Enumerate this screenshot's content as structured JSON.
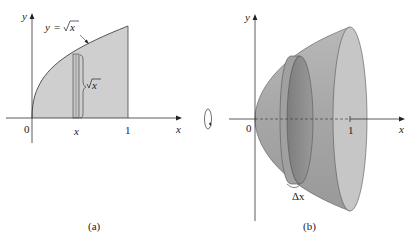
{
  "panel_a": {
    "caption": "(a)",
    "curve_label": "y = √x",
    "curve_label_y": "y",
    "curve_label_eq": "=",
    "curve_label_sqrt": "√",
    "curve_label_x": "x",
    "strip_height_label_sqrt": "√",
    "strip_height_label_x": "x",
    "axis_x_label": "x",
    "axis_y_label": "y",
    "origin_label": "0",
    "tick_x_label": "x",
    "tick_one_label": "1"
  },
  "panel_b": {
    "caption": "(b)",
    "axis_x_label": "x",
    "axis_y_label": "y",
    "origin_label": "0",
    "tick_one_label": "1",
    "disk_width_label": "Δx",
    "rotation_symbol": "rotation-about-x-axis"
  },
  "colors": {
    "region_fill": "#cfcfcf",
    "solid_outer": "#a9a9a9",
    "solid_end_face": "#c4c4c4",
    "disk_face": "#8c8c8c",
    "axis": "#333333"
  }
}
